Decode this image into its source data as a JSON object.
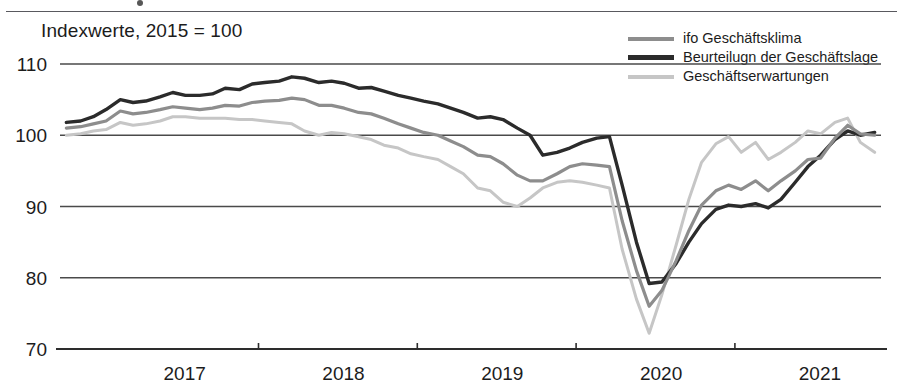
{
  "subtitle": "Indexwerte, 2015 = 100",
  "legend": {
    "items": [
      {
        "label": "ifo Geschäftsklima",
        "color": "#8d8d8d",
        "weight": "medium"
      },
      {
        "label": "Beurteilugn der Geschäftslage",
        "color": "#2b2b2b",
        "weight": "thick"
      },
      {
        "label": "Geschäftserwartungen",
        "color": "#c6c6c6",
        "weight": "light"
      }
    ]
  },
  "chart_data": {
    "type": "line",
    "title": "",
    "subtitle": "Indexwerte, 2015 = 100",
    "xlabel": "",
    "ylabel": "",
    "ylim": [
      70,
      110
    ],
    "yticks": [
      70,
      80,
      90,
      100,
      110
    ],
    "xlim": [
      2016.75,
      2021.92
    ],
    "xticks": [
      2017,
      2018,
      2019,
      2020,
      2021
    ],
    "xtick_labels": [
      "2017",
      "2018",
      "2019",
      "2020",
      "2021"
    ],
    "grid": true,
    "legend_position": "top-right",
    "x": [
      2016.79,
      2016.88,
      2016.96,
      2017.04,
      2017.13,
      2017.21,
      2017.29,
      2017.38,
      2017.46,
      2017.54,
      2017.63,
      2017.71,
      2017.79,
      2017.88,
      2017.96,
      2018.04,
      2018.13,
      2018.21,
      2018.29,
      2018.38,
      2018.46,
      2018.54,
      2018.63,
      2018.71,
      2018.79,
      2018.88,
      2018.96,
      2019.04,
      2019.13,
      2019.21,
      2019.29,
      2019.38,
      2019.46,
      2019.54,
      2019.63,
      2019.71,
      2019.79,
      2019.88,
      2019.96,
      2020.04,
      2020.13,
      2020.21,
      2020.29,
      2020.38,
      2020.46,
      2020.54,
      2020.63,
      2020.71,
      2020.79,
      2020.88,
      2020.96,
      2021.04,
      2021.13,
      2021.21,
      2021.29,
      2021.38,
      2021.46,
      2021.54,
      2021.63,
      2021.71,
      2021.79,
      2021.88
    ],
    "series": [
      {
        "name": "Beurteilugn der Geschäftslage",
        "color": "#2b2b2b",
        "width": 3.4,
        "values": [
          101.8,
          102.0,
          102.6,
          103.6,
          105.0,
          104.6,
          104.8,
          105.4,
          106.0,
          105.6,
          105.6,
          105.8,
          106.6,
          106.4,
          107.2,
          107.4,
          107.6,
          108.2,
          108.0,
          107.4,
          107.6,
          107.3,
          106.6,
          106.7,
          106.2,
          105.6,
          105.2,
          104.8,
          104.4,
          103.8,
          103.2,
          102.4,
          102.6,
          102.2,
          101.0,
          100.0,
          97.2,
          97.6,
          98.2,
          99.0,
          99.6,
          99.8,
          93.0,
          85.0,
          79.2,
          79.4,
          82.0,
          85.0,
          87.6,
          89.6,
          90.2,
          90.0,
          90.4,
          89.8,
          91.0,
          93.4,
          95.6,
          97.2,
          99.4,
          100.6,
          100.0,
          100.4
        ]
      },
      {
        "name": "ifo Geschäftsklima",
        "color": "#8d8d8d",
        "width": 3.2,
        "values": [
          101.0,
          101.2,
          101.6,
          102.0,
          103.4,
          103.0,
          103.2,
          103.6,
          104.0,
          103.8,
          103.6,
          103.8,
          104.2,
          104.1,
          104.6,
          104.8,
          104.9,
          105.2,
          105.0,
          104.2,
          104.2,
          103.8,
          103.2,
          103.0,
          102.4,
          101.6,
          101.0,
          100.4,
          100.0,
          99.2,
          98.4,
          97.2,
          97.0,
          96.0,
          94.4,
          93.6,
          93.6,
          94.6,
          95.6,
          96.0,
          95.8,
          95.6,
          88.0,
          81.0,
          76.0,
          78.2,
          82.4,
          86.6,
          90.2,
          92.2,
          93.0,
          92.4,
          93.6,
          92.2,
          93.6,
          95.0,
          96.6,
          96.8,
          99.6,
          101.4,
          100.2,
          100.0
        ]
      },
      {
        "name": "Geschäftserwartungen",
        "color": "#c6c6c6",
        "width": 3.0,
        "values": [
          100.0,
          100.2,
          100.6,
          100.8,
          101.8,
          101.4,
          101.6,
          102.0,
          102.6,
          102.6,
          102.4,
          102.4,
          102.4,
          102.2,
          102.2,
          102.0,
          101.8,
          101.6,
          100.6,
          100.0,
          100.4,
          100.2,
          99.8,
          99.4,
          98.6,
          98.2,
          97.4,
          97.0,
          96.6,
          95.6,
          94.6,
          92.6,
          92.2,
          90.6,
          90.0,
          91.2,
          92.6,
          93.4,
          93.6,
          93.4,
          93.0,
          92.6,
          84.0,
          77.0,
          72.2,
          77.6,
          84.6,
          91.0,
          96.2,
          98.8,
          99.8,
          97.6,
          99.0,
          96.6,
          97.6,
          99.0,
          100.6,
          100.2,
          101.8,
          102.4,
          99.0,
          97.6
        ]
      }
    ]
  }
}
